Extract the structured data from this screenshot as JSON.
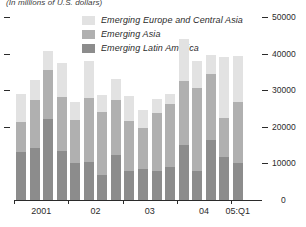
{
  "chart_data": {
    "type": "bar",
    "subtitle": "(In millions of U.S. dollars)",
    "title": "",
    "xlabel": "",
    "ylabel": "",
    "stacked": true,
    "grid": false,
    "legend_position": "top-center",
    "ylim": [
      0,
      50000
    ],
    "yticks": [
      0,
      10000,
      20000,
      30000,
      40000,
      50000
    ],
    "ytick_labels": [
      "0",
      "10000",
      "20000",
      "30000",
      "40000",
      "50000"
    ],
    "left_axis_ticks": [
      20000,
      30000,
      40000,
      50000
    ],
    "x_group_labels": [
      "2001",
      "02",
      "03",
      "04",
      "05:Q1"
    ],
    "categories": [
      "2001:Q1",
      "2001:Q2",
      "2001:Q3",
      "2001:Q4",
      "02:Q1",
      "02:Q2",
      "02:Q3",
      "02:Q4",
      "03:Q1",
      "03:Q2",
      "03:Q3",
      "03:Q4",
      "04:Q1",
      "04:Q2",
      "04:Q3",
      "04:Q4",
      "05:Q1"
    ],
    "series": [
      {
        "name": "Emerging Latin America",
        "color": "#8c8c8c",
        "values": [
          13200,
          14300,
          22200,
          13300,
          10100,
          10500,
          6800,
          12400,
          8000,
          8500,
          7900,
          9100,
          15100,
          8000,
          16300,
          11700,
          10200
        ]
      },
      {
        "name": "Emerging Asia",
        "color": "#b0b0b0",
        "values": [
          8000,
          13000,
          13200,
          14800,
          11800,
          17500,
          17200,
          14800,
          13500,
          11200,
          16000,
          17100,
          17400,
          22500,
          18100,
          10800,
          16600
        ]
      },
      {
        "name": "Emerging Europe and Central Asia",
        "color": "#e2e2e2",
        "values": [
          7800,
          5400,
          5400,
          9300,
          4900,
          9900,
          4800,
          5800,
          7000,
          5000,
          3700,
          2800,
          11400,
          7400,
          5300,
          16600,
          12500
        ]
      }
    ],
    "totals": [
      29000,
      32700,
      40800,
      37400,
      26800,
      37900,
      28800,
      33000,
      28500,
      24700,
      27600,
      29000,
      43600,
      37900,
      39700,
      39100,
      39300
    ]
  },
  "legend": {
    "items": [
      {
        "label": "Emerging Europe and Central Asia",
        "key": "eeca"
      },
      {
        "label": "Emerging Asia",
        "key": "asia"
      },
      {
        "label": "Emerging Latin America",
        "key": "lat"
      }
    ]
  }
}
